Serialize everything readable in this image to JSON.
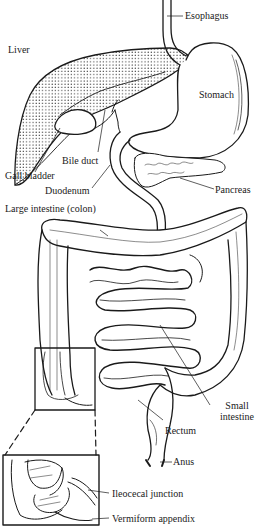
{
  "figure": {
    "labels": {
      "esophagus": "Esophagus",
      "liver": "Liver",
      "stomach": "Stomach",
      "bile_duct": "Bile duct",
      "gall_bladder": "Gall bladder",
      "duodenum": "Duodenum",
      "pancreas": "Pancreas",
      "large_intestine": "Large intestine (colon)",
      "small_intestine_1": "Small",
      "small_intestine_2": "intestine",
      "rectum": "Rectum",
      "anus": "Anus",
      "ileocecal_junction": "Ileocecal junction",
      "vermiform_appendix": "Vermiform appendix"
    },
    "colors": {
      "line": "#1a1a1a",
      "background": "#ffffff",
      "liver_stipple": "#222222"
    }
  }
}
